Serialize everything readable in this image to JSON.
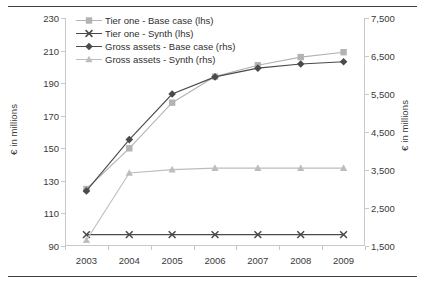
{
  "chart_data": {
    "type": "line",
    "title": "",
    "xlabel": "",
    "ylabel": "€ in millions",
    "y2label": "€ in millions",
    "categories": [
      "2003",
      "2004",
      "2005",
      "2006",
      "2007",
      "2008",
      "2009"
    ],
    "x_tick_labels": [
      "2003",
      "2004",
      "2005",
      "2006",
      "2007",
      "2008",
      "2009"
    ],
    "ylim": [
      90,
      230
    ],
    "y_ticks": [
      90,
      110,
      130,
      150,
      170,
      190,
      210,
      230
    ],
    "y_tick_labels": [
      "90",
      "110",
      "130",
      "150",
      "170",
      "190",
      "210",
      "230"
    ],
    "y2lim": [
      1500,
      7500
    ],
    "y2_ticks": [
      1500,
      2500,
      3500,
      4500,
      5500,
      6500,
      7500
    ],
    "y2_tick_labels": [
      "1,500",
      "2,500",
      "3,500",
      "4,500",
      "5,500",
      "6,500",
      "7,500"
    ],
    "grid": false,
    "legend_position": "top-left",
    "series": [
      {
        "name": "Tier one - Base case (lhs)",
        "axis": "left",
        "marker": "square",
        "color": "#b3b3b3",
        "values": [
          125,
          150,
          178,
          194,
          201,
          206,
          209
        ]
      },
      {
        "name": "Tier one - Synth (lhs)",
        "axis": "left",
        "marker": "cross",
        "color": "#4a4a4a",
        "values": [
          97,
          97,
          97,
          97,
          97,
          97,
          97
        ]
      },
      {
        "name": "Gross assets - Base case (rhs)",
        "axis": "right",
        "marker": "diamond",
        "color": "#4a4a4a",
        "values": [
          2950,
          4300,
          5500,
          5950,
          6180,
          6290,
          6350
        ]
      },
      {
        "name": "Gross assets - Synth (rhs)",
        "axis": "right",
        "marker": "triangle",
        "color": "#bdbdbd",
        "values": [
          1650,
          3420,
          3510,
          3550,
          3550,
          3550,
          3550
        ]
      }
    ]
  },
  "legend": {
    "items": [
      {
        "label": "Tier one - Base case (lhs)",
        "marker": "square-marker-icon",
        "color": "#b3b3b3"
      },
      {
        "label": "Tier one - Synth (lhs)",
        "marker": "cross-marker-icon",
        "color": "#4a4a4a"
      },
      {
        "label": "Gross assets - Base case (rhs)",
        "marker": "diamond-marker-icon",
        "color": "#4a4a4a"
      },
      {
        "label": "Gross assets - Synth (rhs)",
        "marker": "triangle-marker-icon",
        "color": "#bdbdbd"
      }
    ]
  },
  "colors": {
    "light_gray": "#b3b3b3",
    "lighter_gray": "#bdbdbd",
    "dark_gray": "#4a4a4a",
    "axis_gray": "#c9c9c9",
    "text": "#3a3a3a",
    "rule": "#3f3f3f"
  }
}
